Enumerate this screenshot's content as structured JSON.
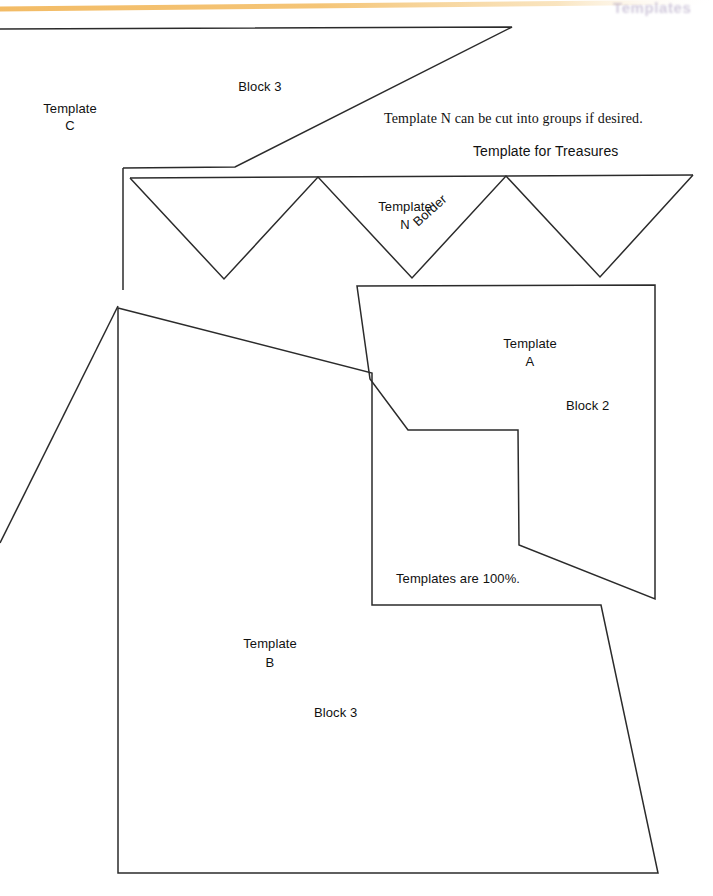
{
  "page": {
    "width": 713,
    "height": 896,
    "background": "#ffffff",
    "line_color": "#2b2b2b",
    "header_rule_color": "#f0b35a",
    "faded_header_color": "#8d7aa8"
  },
  "header": {
    "running_head_faded": "Templates",
    "rule_label": "header-rule"
  },
  "labels": {
    "block3_top": "Block 3",
    "template_c_line1": "Template",
    "template_c_line2": "C",
    "note_cut_groups": "Template N can be cut into groups if desired.",
    "template_for_treasures": "Template for Treasures",
    "template_n_line1": "Template",
    "template_n_line2": "N",
    "border": "Border",
    "template_a_line1": "Template",
    "template_a_line2": "A",
    "block2": "Block 2",
    "templates_are_100": "Templates are 100%.",
    "template_b_line1": "Template",
    "template_b_line2": "B",
    "block3_bottom": "Block 3"
  },
  "shapes": {
    "template_c": {
      "name": "Template C",
      "block": "Block 3",
      "points": "0,29 512,27 235,167 123,168"
    },
    "template_n_border": {
      "name": "Template N",
      "role": "Border",
      "zigzag_top_y": 178,
      "zigzag_bottom_y": 279,
      "peaks_x": [
        130,
        318,
        506,
        693
      ],
      "valleys_x": [
        224,
        412,
        600
      ],
      "left_wall_x": 123,
      "left_wall_top_y": 168,
      "left_wall_bottom_y": 290
    },
    "template_a": {
      "name": "Template A",
      "block": "Block 2",
      "points": "357,286 655,285 655,599 519,545 518,430 408,430 370,379"
    },
    "template_b": {
      "name": "Template B",
      "block": "Block 3",
      "points": "118,308 372,373 372,605 601,605 658,873 118,873"
    },
    "left_diagonal": {
      "name": "left-diagonal-edge",
      "from": "118,306",
      "to": "0,543"
    }
  }
}
